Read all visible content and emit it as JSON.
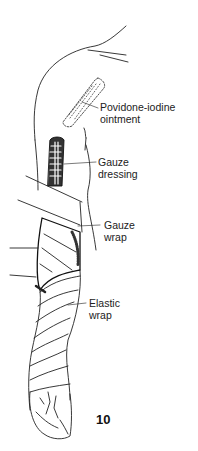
{
  "figure": {
    "number": "10"
  },
  "labels": [
    {
      "id": "povidone",
      "lines": [
        "Povidone-iodine",
        "ointment"
      ]
    },
    {
      "id": "gauze-dressing",
      "lines": [
        "Gauze",
        "dressing"
      ]
    },
    {
      "id": "gauze-wrap",
      "lines": [
        "Gauze",
        "wrap"
      ]
    },
    {
      "id": "elastic-wrap",
      "lines": [
        "Elastic",
        "wrap"
      ]
    }
  ],
  "colors": {
    "ink": "#222222",
    "background": "#ffffff"
  }
}
